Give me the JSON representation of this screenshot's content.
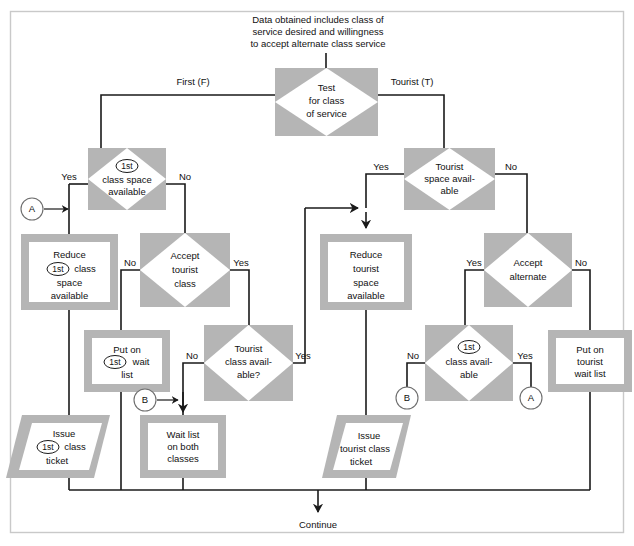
{
  "diagram": {
    "title_caption": {
      "line1": "Data obtained includes class of",
      "line2": "service desired and willingness",
      "line3": "to accept alternate class service"
    },
    "terminal": {
      "continue_label": "Continue"
    },
    "nodes": {
      "test_class": {
        "shape": "decision",
        "lines": [
          "Test",
          "for class",
          "of service"
        ]
      },
      "first_space": {
        "shape": "decision",
        "lines": [
          "1st",
          "class space",
          "available"
        ],
        "badge": "1st"
      },
      "tourist_space": {
        "shape": "decision",
        "lines": [
          "Tourist",
          "space avail-",
          "able"
        ]
      },
      "reduce_first": {
        "shape": "process",
        "lines": [
          "Reduce",
          "1st class",
          "space",
          "available"
        ],
        "badge": "1st"
      },
      "accept_tourist": {
        "shape": "decision",
        "lines": [
          "Accept",
          "tourist",
          "class"
        ]
      },
      "reduce_tourist": {
        "shape": "process",
        "lines": [
          "Reduce",
          "tourist",
          "space",
          "available"
        ]
      },
      "accept_alternate": {
        "shape": "decision",
        "lines": [
          "Accept",
          "alternate"
        ]
      },
      "put_on_first_wait": {
        "shape": "process",
        "lines": [
          "Put on",
          "1st wait",
          "list"
        ],
        "badge": "1st"
      },
      "tourist_class_available": {
        "shape": "decision",
        "lines": [
          "Tourist",
          "class avail-",
          "able?"
        ]
      },
      "first_class_available": {
        "shape": "decision",
        "lines": [
          "1st",
          "class avail-",
          "able"
        ],
        "badge": "1st"
      },
      "put_on_tourist_wait": {
        "shape": "process",
        "lines": [
          "Put on",
          "tourist",
          "wait list"
        ]
      },
      "issue_first_ticket": {
        "shape": "output",
        "lines": [
          "Issue",
          "1st class",
          "ticket"
        ],
        "badge": "1st"
      },
      "wait_list_both": {
        "shape": "process",
        "lines": [
          "Wait list",
          "on both",
          "classes"
        ]
      },
      "issue_tourist_ticket": {
        "shape": "output",
        "lines": [
          "Issue",
          "tourist class",
          "ticket"
        ]
      }
    },
    "edge_labels": {
      "first_f": "First (F)",
      "tourist_t": "Tourist (T)",
      "yes_first_space": "Yes",
      "no_first_space": "No",
      "yes_tourist_space": "Yes",
      "no_tourist_space": "No",
      "no_accept_tourist": "No",
      "yes_accept_tourist": "Yes",
      "yes_accept_alternate": "Yes",
      "no_accept_alternate": "No",
      "no_tourist_class_avail": "No",
      "yes_tourist_class_avail": "Yes",
      "no_first_class_avail": "No",
      "yes_first_class_avail": "Yes"
    },
    "connectors": {
      "a_left": "A",
      "b_mid": "B",
      "b_right": "B",
      "a_right": "A"
    },
    "colors": {
      "shape_gray": "#b5b5b5",
      "shape_white": "#ffffff",
      "line": "#1a1a1a",
      "frame": "#c9c9c9",
      "text": "#111111"
    }
  }
}
